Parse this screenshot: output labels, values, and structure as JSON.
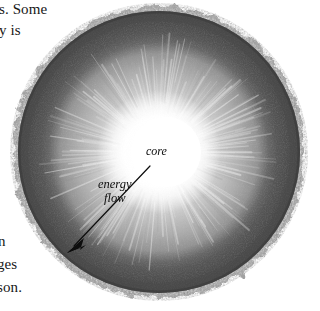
{
  "page": {
    "kind": "textbook-figure",
    "figure_type": "sun-cutaway-diagram",
    "background_color": "#ffffff"
  },
  "body_text": {
    "top_line_1": "s. Some",
    "top_line_2": "y is",
    "bottom_line_1": "n",
    "bottom_line_2": "ges",
    "bottom_line_3": "son."
  },
  "figure": {
    "labels": {
      "core": "core",
      "energy_flow_line1": "energy",
      "energy_flow_line2": "flow"
    },
    "arrow": {
      "name": "energy-flow-arrow",
      "tail_x": 150,
      "tail_y": 166,
      "tip_x": 67,
      "tip_y": 253,
      "color": "#0d0d0d"
    },
    "geometry": {
      "center_x": 159,
      "center_y": 152,
      "core_radius": 36,
      "radiative_zone_radius": 104,
      "convective_zone_radius": 134,
      "surface_radius": 141
    },
    "colors": {
      "core": "#ffffff",
      "inner_glow": "#f2f2f2",
      "radiative_zone": "#b9b9b9",
      "convective_zone": "#6f6f6f",
      "outer_band": "#4a4a4a",
      "granulated_rim": "#8d8d8d",
      "label_text": "#0d0d0d",
      "body_text": "#171717"
    }
  }
}
